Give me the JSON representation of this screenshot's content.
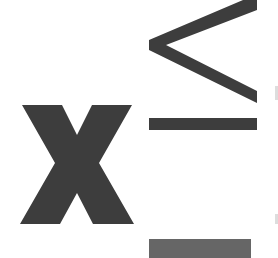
{
  "figure": {
    "symbols": [
      {
        "name": "variable-x",
        "glyph": "x"
      },
      {
        "name": "less-than-or-equal",
        "glyph": "≤"
      }
    ],
    "colors": {
      "glyph": "#3d3d3d",
      "bottom_bar": "#666666",
      "background": "#ffffff"
    }
  }
}
